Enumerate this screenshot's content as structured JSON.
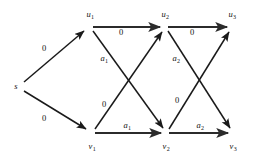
{
  "diagram": {
    "type": "directed-layered-graph",
    "width": 253,
    "height": 160,
    "background_color": "#ffffff",
    "stroke_color": "#1a1a1a",
    "text_color": "#111111",
    "nodes": [
      {
        "id": "s",
        "base": "s",
        "sub": "",
        "x": 18,
        "y": 86,
        "label_x": 16,
        "label_y": 86,
        "label_anchor": "right-of-node"
      },
      {
        "id": "u1",
        "base": "u",
        "sub": "1",
        "x": 90,
        "y": 27,
        "label_x": 90,
        "label_y": 14
      },
      {
        "id": "u2",
        "base": "u",
        "sub": "2",
        "x": 165,
        "y": 27,
        "label_x": 165,
        "label_y": 14
      },
      {
        "id": "u3",
        "base": "u",
        "sub": "3",
        "x": 232,
        "y": 27,
        "label_x": 232,
        "label_y": 14
      },
      {
        "id": "v1",
        "base": "v",
        "sub": "1",
        "x": 92,
        "y": 133,
        "label_x": 92,
        "label_y": 146
      },
      {
        "id": "v2",
        "base": "v",
        "sub": "2",
        "x": 166,
        "y": 133,
        "label_x": 166,
        "label_y": 146
      },
      {
        "id": "v3",
        "base": "v",
        "sub": "3",
        "x": 233,
        "y": 133,
        "label_x": 233,
        "label_y": 146
      }
    ],
    "edges": [
      {
        "id": "s-u1",
        "from": "s",
        "to": "u1",
        "label": "0",
        "label_style": "plain",
        "label_x": 44,
        "label_y": 48,
        "weight": "thin"
      },
      {
        "id": "s-v1",
        "from": "s",
        "to": "v1",
        "label": "0",
        "label_style": "plain",
        "label_x": 44,
        "label_y": 118,
        "weight": "thin"
      },
      {
        "id": "u1-u2",
        "from": "u1",
        "to": "u2",
        "label": "0",
        "label_style": "plain",
        "label_x": 121,
        "label_y": 32,
        "weight": "thick"
      },
      {
        "id": "u1-v2",
        "from": "u1",
        "to": "v2",
        "label": "a",
        "label_sub": "1",
        "label_style": "italic",
        "label_x": 104,
        "label_y": 58,
        "weight": "thin"
      },
      {
        "id": "v1-u2",
        "from": "v1",
        "to": "u2",
        "label": "0",
        "label_style": "plain",
        "label_x": 104,
        "label_y": 104,
        "weight": "thin"
      },
      {
        "id": "v1-v2",
        "from": "v1",
        "to": "v2",
        "label": "a",
        "label_sub": "1",
        "label_style": "italic",
        "label_x": 127,
        "label_y": 125,
        "weight": "thick"
      },
      {
        "id": "u2-u3",
        "from": "u2",
        "to": "u3",
        "label": "0",
        "label_style": "plain",
        "label_x": 192,
        "label_y": 32,
        "weight": "thick"
      },
      {
        "id": "u2-v3",
        "from": "u2",
        "to": "v3",
        "label": "a",
        "label_sub": "2",
        "label_style": "italic",
        "label_x": 176,
        "label_y": 58,
        "weight": "thin"
      },
      {
        "id": "v2-u3",
        "from": "v2",
        "to": "u3",
        "label": "0",
        "label_style": "plain",
        "label_x": 177,
        "label_y": 100,
        "weight": "thin"
      },
      {
        "id": "v2-v3",
        "from": "v2",
        "to": "v3",
        "label": "a",
        "label_sub": "2",
        "label_style": "italic",
        "label_x": 200,
        "label_y": 125,
        "weight": "thick"
      }
    ]
  }
}
